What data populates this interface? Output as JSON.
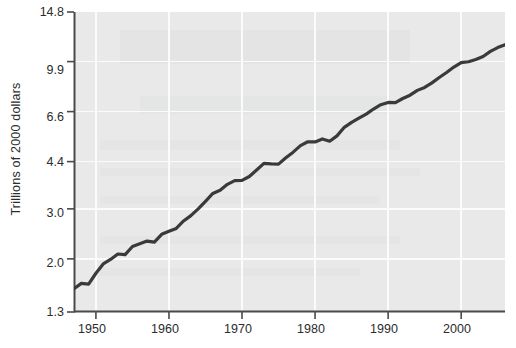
{
  "chart_data": {
    "type": "line",
    "title": "",
    "subtitle": "",
    "xlabel": "",
    "ylabel": "Trillions of 2000 dollars",
    "yscale": "log",
    "ylim": [
      1.3,
      14.8
    ],
    "xlim": [
      1947,
      2006
    ],
    "grid": true,
    "legend": null,
    "legend_position": "none",
    "y_ticks": [
      1.3,
      2.0,
      3.0,
      4.4,
      6.6,
      9.9,
      14.8
    ],
    "y_tick_labels": [
      "1.3",
      "2.0",
      "3.0",
      "4.4",
      "6.6",
      "9.9",
      "14.8"
    ],
    "x_ticks": [
      1950,
      1960,
      1970,
      1980,
      1990,
      2000
    ],
    "x_tick_labels": [
      "1950",
      "1960",
      "1970",
      "1980",
      "1990",
      "2000"
    ],
    "series": [
      {
        "name": "Real GDP",
        "color": "#3a3a3a",
        "x": [
          1947,
          1948,
          1949,
          1950,
          1951,
          1952,
          1953,
          1954,
          1955,
          1956,
          1957,
          1958,
          1959,
          1960,
          1961,
          1962,
          1963,
          1964,
          1965,
          1966,
          1967,
          1968,
          1969,
          1970,
          1971,
          1972,
          1973,
          1974,
          1975,
          1976,
          1977,
          1978,
          1979,
          1980,
          1981,
          1982,
          1983,
          1984,
          1985,
          1986,
          1987,
          1988,
          1989,
          1990,
          1991,
          1992,
          1993,
          1994,
          1995,
          1996,
          1997,
          1998,
          1999,
          2000,
          2001,
          2002,
          2003,
          2004,
          2005,
          2006
        ],
        "values": [
          1.57,
          1.64,
          1.63,
          1.78,
          1.92,
          1.99,
          2.08,
          2.07,
          2.21,
          2.26,
          2.31,
          2.29,
          2.44,
          2.5,
          2.56,
          2.72,
          2.84,
          3.0,
          3.19,
          3.4,
          3.49,
          3.66,
          3.77,
          3.78,
          3.9,
          4.11,
          4.34,
          4.32,
          4.31,
          4.54,
          4.75,
          5.01,
          5.17,
          5.16,
          5.29,
          5.19,
          5.42,
          5.81,
          6.05,
          6.26,
          6.47,
          6.74,
          6.98,
          7.11,
          7.1,
          7.34,
          7.54,
          7.84,
          8.03,
          8.33,
          8.7,
          9.06,
          9.47,
          9.82,
          9.89,
          10.07,
          10.32,
          10.76,
          11.09,
          11.35
        ]
      }
    ]
  }
}
